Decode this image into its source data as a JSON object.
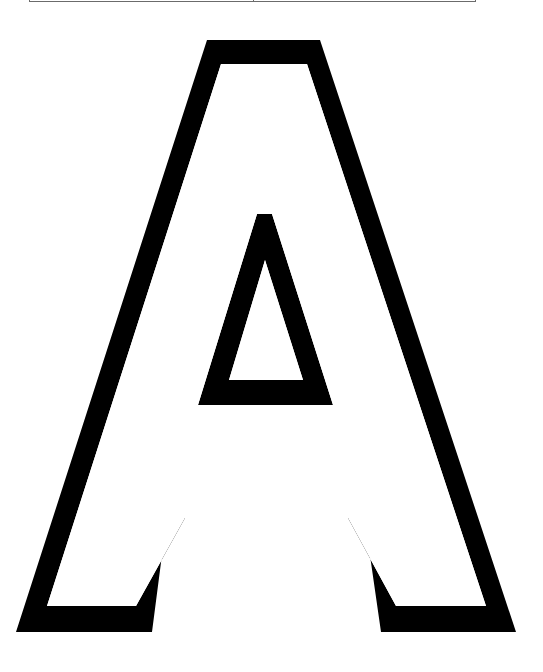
{
  "page": {
    "letter": "A",
    "style": "outline",
    "stroke_color": "#000000",
    "fill_color": "#ffffff",
    "background": "#ffffff"
  },
  "table_fragment": {
    "columns": 2,
    "border_color": "#6b6b6b"
  }
}
